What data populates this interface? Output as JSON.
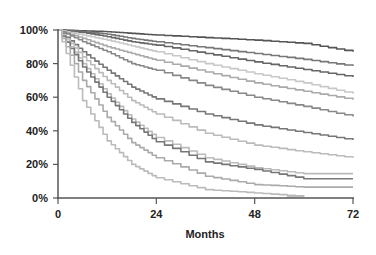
{
  "chart_data": {
    "type": "line",
    "title": "",
    "xlabel": "Months",
    "ylabel": "",
    "xlim": [
      0,
      72
    ],
    "ylim": [
      0,
      100
    ],
    "x_ticks": [
      0,
      24,
      48,
      72
    ],
    "y_ticks": [
      0,
      20,
      40,
      60,
      80,
      100
    ],
    "y_tick_labels": [
      "0%",
      "20%",
      "40%",
      "60%",
      "80%",
      "100%"
    ],
    "x_tick_labels": [
      "0",
      "24",
      "48",
      "72"
    ],
    "grid": false,
    "legend": null,
    "x": [
      0,
      6,
      12,
      18,
      24,
      36,
      48,
      60,
      72
    ],
    "series": [
      {
        "name": "curve-1",
        "color": "#555555",
        "values": [
          100,
          99.5,
          99,
          98,
          97,
          95.5,
          94,
          92,
          87
        ]
      },
      {
        "name": "curve-2",
        "color": "#777777",
        "values": [
          100,
          99,
          97.5,
          95,
          93,
          89.5,
          86,
          82.5,
          78.5
        ]
      },
      {
        "name": "curve-3",
        "color": "#666666",
        "values": [
          100,
          98.5,
          96,
          93,
          91,
          86,
          81,
          76.5,
          72
        ]
      },
      {
        "name": "curve-4",
        "color": "#c8c8c8",
        "values": [
          100,
          97,
          94,
          90.5,
          87,
          80,
          74,
          68.5,
          62
        ]
      },
      {
        "name": "curve-5",
        "color": "#aaaaaa",
        "values": [
          100,
          95,
          90,
          86,
          82,
          75,
          68.5,
          63.5,
          58.5
        ]
      },
      {
        "name": "curve-6",
        "color": "#888888",
        "values": [
          100,
          93,
          87,
          80,
          76,
          67,
          60,
          54.5,
          48.5
        ]
      },
      {
        "name": "curve-7",
        "color": "#777777",
        "values": [
          100,
          87,
          76,
          66,
          59,
          50,
          43.5,
          39,
          34.5
        ]
      },
      {
        "name": "curve-8",
        "color": "#bbbbbb",
        "values": [
          100,
          84,
          70,
          58,
          50,
          38.5,
          31.5,
          27.5,
          24
        ]
      },
      {
        "name": "curve-9",
        "color": "#bbbbbb",
        "values": [
          100,
          80,
          62,
          47,
          36,
          24,
          18,
          14.5,
          14.5
        ]
      },
      {
        "name": "curve-10",
        "color": "#777777",
        "values": [
          100,
          78,
          60,
          45,
          33.5,
          21.5,
          17,
          11.5,
          11.5
        ]
      },
      {
        "name": "curve-11",
        "color": "#aaaaaa",
        "values": [
          100,
          70,
          48,
          33,
          24,
          13,
          8,
          6.5,
          6.5
        ]
      },
      {
        "name": "curve-12",
        "color": "#bbbbbb",
        "values": [
          100,
          58,
          34,
          20,
          12,
          5,
          3,
          1,
          null
        ]
      }
    ]
  }
}
